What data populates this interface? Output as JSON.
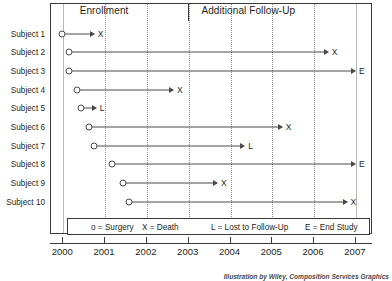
{
  "chart_data": {
    "type": "timeline",
    "title": "",
    "xlabel": "",
    "ylabel": "",
    "xlim": [
      2000,
      2007.4
    ],
    "grid": true,
    "x_ticks": [
      2000,
      2001,
      2002,
      2003,
      2004,
      2005,
      2006,
      2007
    ],
    "x_tick_labels": [
      "2000",
      "2001",
      "2002",
      "2003",
      "2004",
      "2005",
      "2006",
      "2007"
    ],
    "categories": [
      "Subject 1",
      "Subject 2",
      "Subject 3",
      "Subject 4",
      "Subject 5",
      "Subject 6",
      "Subject 7",
      "Subject 8",
      "Subject 9",
      "Subject 10"
    ],
    "phases": [
      {
        "label": "Enrollment",
        "start": 2000,
        "end": 2003,
        "center": 2001.0
      },
      {
        "label": "Additional Follow-Up",
        "start": 2003,
        "end": 2007.4,
        "center": 2004.45
      }
    ],
    "series": [
      {
        "name": "Subject 1",
        "start": 2000.0,
        "end": 2000.75,
        "start_marker": "o",
        "end_marker": "X"
      },
      {
        "name": "Subject 2",
        "start": 2000.15,
        "end": 2006.35,
        "start_marker": "o",
        "end_marker": "X"
      },
      {
        "name": "Subject 3",
        "start": 2000.15,
        "end": 2007.0,
        "start_marker": "o",
        "end_marker": "E"
      },
      {
        "name": "Subject 4",
        "start": 2000.35,
        "end": 2002.65,
        "start_marker": "o",
        "end_marker": "X"
      },
      {
        "name": "Subject 5",
        "start": 2000.45,
        "end": 2000.8,
        "start_marker": "o",
        "end_marker": "L"
      },
      {
        "name": "Subject 6",
        "start": 2000.65,
        "end": 2005.25,
        "start_marker": "o",
        "end_marker": "X"
      },
      {
        "name": "Subject 7",
        "start": 2000.75,
        "end": 2004.35,
        "start_marker": "o",
        "end_marker": "L"
      },
      {
        "name": "Subject 8",
        "start": 2001.2,
        "end": 2007.0,
        "start_marker": "o",
        "end_marker": "E"
      },
      {
        "name": "Subject 9",
        "start": 2001.45,
        "end": 2003.7,
        "start_marker": "o",
        "end_marker": "X"
      },
      {
        "name": "Subject 10",
        "start": 2001.6,
        "end": 2006.8,
        "start_marker": "o",
        "end_marker": "X"
      }
    ],
    "legend": [
      {
        "symbol": "o",
        "text": "o = Surgery"
      },
      {
        "symbol": "X",
        "text": "X = Death"
      },
      {
        "symbol": "L",
        "text": "L = Lost to Follow-Up"
      },
      {
        "symbol": "E",
        "text": "E = End Study"
      }
    ],
    "legend_position": "inside-bottom"
  },
  "caption": "Illustration by Wiley, Composition Services Graphics",
  "colors": {
    "frame": "#3a3a3a",
    "line": "#4a4a4a",
    "grid": "#8e8e8e",
    "text": "#231f20",
    "background": "#ffffff"
  }
}
